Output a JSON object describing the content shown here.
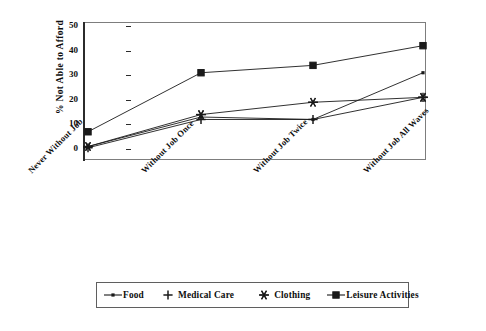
{
  "chart_data": {
    "type": "line",
    "title": "",
    "xlabel": "",
    "ylabel": "% Not Able to Afford",
    "categories": [
      "Never Without Job",
      "Without Job Once",
      "Without Job Twice",
      "Without Job All Waves"
    ],
    "ylim": [
      0,
      50
    ],
    "yticks": [
      0,
      10,
      20,
      30,
      40,
      50
    ],
    "ytick_labels": [
      "0",
      "10",
      "20",
      "30",
      "40",
      "50"
    ],
    "grid": false,
    "legend_position": "bottom",
    "series": [
      {
        "name": "Food",
        "marker": "small-line-dot",
        "values": [
          1,
          13,
          12,
          31
        ]
      },
      {
        "name": "Medical Care",
        "marker": "plus",
        "values": [
          0.5,
          12,
          12,
          21
        ]
      },
      {
        "name": "Clothing",
        "marker": "asterisk",
        "values": [
          1,
          14,
          19,
          21
        ]
      },
      {
        "name": "Leisure Activities",
        "marker": "square",
        "values": [
          7,
          31,
          34,
          42
        ]
      }
    ]
  },
  "axes": {
    "y_title": "% Not Able to Afford",
    "y_tick_labels": [
      "50",
      "40",
      "30",
      "20",
      "10",
      "0"
    ],
    "x_tick_labels": [
      "Never Without Job",
      "Without Job Once",
      "Without Job Twice",
      "Without Job All Waves"
    ]
  },
  "legend": {
    "items": [
      {
        "label": "Food",
        "icon": "line-marker-icon"
      },
      {
        "label": "Medical Care",
        "icon": "plus-marker-icon"
      },
      {
        "label": "Clothing",
        "icon": "asterisk-marker-icon"
      },
      {
        "label": "Leisure Activities",
        "icon": "square-marker-icon"
      }
    ]
  },
  "colors": {
    "series": "#1a1a1a",
    "frame": "#7d7d7d",
    "axis": "#2b2b2b",
    "background": "#ffffff"
  }
}
